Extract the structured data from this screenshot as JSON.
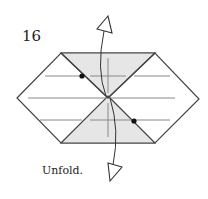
{
  "step": {
    "number": "16"
  },
  "instruction": {
    "text": "Unfold."
  },
  "colors": {
    "paper_white": "#ffffff",
    "paper_shaded": "#e6e6e6",
    "edge": "#444444",
    "crease": "#888888",
    "dot": "#111111"
  },
  "figure": {
    "shape": "hexagon",
    "shaded_regions": [
      "top-inverted-triangle",
      "bottom-triangle"
    ],
    "creases": [
      "horizontal-upper",
      "horizontal-middle",
      "horizontal-lower",
      "vertical-upper",
      "vertical-lower"
    ],
    "reference_dots": 2,
    "arrows": [
      "unfold-arrow-up",
      "unfold-arrow-down"
    ]
  }
}
